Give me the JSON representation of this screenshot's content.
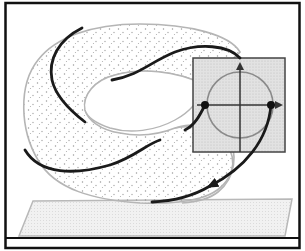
{
  "figure": {
    "colors": {
      "background": "#ffffff",
      "frame": "#111111",
      "torus_outline": "#b5b5b5",
      "torus_stipple": "#9a9a9a",
      "trajectory": "#1a1a1a",
      "section_fill": "#d6d6d6",
      "section_border": "#444444",
      "circle": "#8a8a8a",
      "axes": "#333333",
      "floor_fill": "#ececec",
      "floor_outline": "#b0b0b0"
    },
    "elements": {
      "section_plane": {
        "x": 193,
        "y": 58,
        "width": 92,
        "height": 94
      },
      "circle": {
        "cx": 240,
        "cy": 105,
        "r": 33
      },
      "intersection_points": [
        {
          "x": 205,
          "y": 105
        },
        {
          "x": 271,
          "y": 105
        }
      ]
    }
  }
}
